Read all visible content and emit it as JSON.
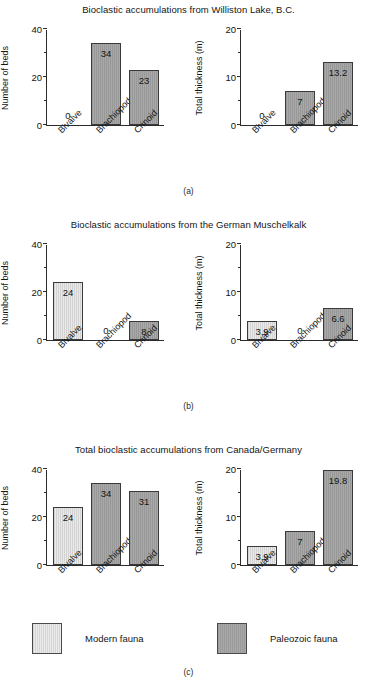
{
  "figure": {
    "panels": [
      {
        "caption": "(a)",
        "title": "Bioclastic accumulations from Williston Lake, B.C.",
        "charts": [
          {
            "ylabel": "Number of beds",
            "yticks": [
              "0",
              "20",
              "40"
            ],
            "ymax": 40,
            "categories": [
              "Bivalve",
              "Brachiopod",
              "Crinoid"
            ],
            "values": [
              0,
              34,
              23
            ],
            "labels": [
              "0",
              "34",
              "23"
            ],
            "fauna": [
              "modern",
              "paleo",
              "paleo"
            ]
          },
          {
            "ylabel": "Total thickness (m)",
            "yticks": [
              "0",
              "10",
              "20"
            ],
            "ymax": 20,
            "categories": [
              "Bivalve",
              "Brachiopod",
              "Crinoid"
            ],
            "values": [
              0,
              7,
              13.2
            ],
            "labels": [
              "0",
              "7",
              "13.2"
            ],
            "fauna": [
              "modern",
              "paleo",
              "paleo"
            ]
          }
        ]
      },
      {
        "caption": "(b)",
        "title": "Bioclastic accumulations from the German Muschelkalk",
        "charts": [
          {
            "ylabel": "Number of beds",
            "yticks": [
              "0",
              "20",
              "40"
            ],
            "ymax": 40,
            "categories": [
              "Bivalve",
              "Brachiopod",
              "Crinoid"
            ],
            "values": [
              24,
              0,
              8
            ],
            "labels": [
              "24",
              "0",
              "8"
            ],
            "fauna": [
              "modern",
              "paleo",
              "paleo"
            ]
          },
          {
            "ylabel": "Total thickness (m)",
            "yticks": [
              "0",
              "10",
              "20"
            ],
            "ymax": 20,
            "categories": [
              "Bivalve",
              "Brachiopod",
              "Crinoid"
            ],
            "values": [
              3.9,
              0,
              6.6
            ],
            "labels": [
              "3.9",
              "0",
              "6.6"
            ],
            "fauna": [
              "modern",
              "paleo",
              "paleo"
            ]
          }
        ]
      },
      {
        "caption": "(c)",
        "title": "Total bioclastic accumulations from Canada/Germany",
        "charts": [
          {
            "ylabel": "Number of beds",
            "yticks": [
              "0",
              "20",
              "40"
            ],
            "ymax": 40,
            "categories": [
              "Bivalve",
              "Brachiopod",
              "Crinoid"
            ],
            "values": [
              24,
              34,
              31
            ],
            "labels": [
              "24",
              "34",
              "31"
            ],
            "fauna": [
              "modern",
              "paleo",
              "paleo"
            ]
          },
          {
            "ylabel": "Total thickness (m)",
            "yticks": [
              "0",
              "10",
              "20"
            ],
            "ymax": 20,
            "categories": [
              "Bivalve",
              "Brachiopod",
              "Crinoid"
            ],
            "values": [
              3.9,
              7,
              19.8
            ],
            "labels": [
              "3.9",
              "7",
              "19.8"
            ],
            "fauna": [
              "modern",
              "paleo",
              "paleo"
            ]
          }
        ]
      }
    ],
    "legend": [
      {
        "label": "Modern fauna",
        "fauna": "modern",
        "color": "#e9e9e9"
      },
      {
        "label": "Paleozoic fauna",
        "fauna": "paleo",
        "color": "#a9a9a9"
      }
    ]
  },
  "chart_data": [
    {
      "type": "bar",
      "panel": "(a)",
      "subplot": "left",
      "title": "Bioclastic accumulations from Williston Lake, B.C.",
      "xlabel": "",
      "ylabel": "Number of beds",
      "categories": [
        "Bivalve",
        "Brachiopod",
        "Crinoid"
      ],
      "values": [
        0,
        34,
        23
      ],
      "ylim": [
        0,
        40
      ],
      "yticks": [
        0,
        20,
        40
      ],
      "grid": false,
      "legend_position": "bottom",
      "series_group": [
        "Modern fauna",
        "Paleozoic fauna",
        "Paleozoic fauna"
      ]
    },
    {
      "type": "bar",
      "panel": "(a)",
      "subplot": "right",
      "title": "Bioclastic accumulations from Williston Lake, B.C.",
      "xlabel": "",
      "ylabel": "Total thickness (m)",
      "categories": [
        "Bivalve",
        "Brachiopod",
        "Crinoid"
      ],
      "values": [
        0,
        7,
        13.2
      ],
      "ylim": [
        0,
        20
      ],
      "yticks": [
        0,
        10,
        20
      ],
      "grid": false,
      "legend_position": "bottom",
      "series_group": [
        "Modern fauna",
        "Paleozoic fauna",
        "Paleozoic fauna"
      ]
    },
    {
      "type": "bar",
      "panel": "(b)",
      "subplot": "left",
      "title": "Bioclastic accumulations from the German Muschelkalk",
      "xlabel": "",
      "ylabel": "Number of beds",
      "categories": [
        "Bivalve",
        "Brachiopod",
        "Crinoid"
      ],
      "values": [
        24,
        0,
        8
      ],
      "ylim": [
        0,
        40
      ],
      "yticks": [
        0,
        20,
        40
      ],
      "grid": false,
      "legend_position": "bottom",
      "series_group": [
        "Modern fauna",
        "Paleozoic fauna",
        "Paleozoic fauna"
      ]
    },
    {
      "type": "bar",
      "panel": "(b)",
      "subplot": "right",
      "title": "Bioclastic accumulations from the German Muschelkalk",
      "xlabel": "",
      "ylabel": "Total thickness (m)",
      "categories": [
        "Bivalve",
        "Brachiopod",
        "Crinoid"
      ],
      "values": [
        3.9,
        0,
        6.6
      ],
      "ylim": [
        0,
        20
      ],
      "yticks": [
        0,
        10,
        20
      ],
      "grid": false,
      "legend_position": "bottom",
      "series_group": [
        "Modern fauna",
        "Paleozoic fauna",
        "Paleozoic fauna"
      ]
    },
    {
      "type": "bar",
      "panel": "(c)",
      "subplot": "left",
      "title": "Total bioclastic accumulations from Canada/Germany",
      "xlabel": "",
      "ylabel": "Number of beds",
      "categories": [
        "Bivalve",
        "Brachiopod",
        "Crinoid"
      ],
      "values": [
        24,
        34,
        31
      ],
      "ylim": [
        0,
        40
      ],
      "yticks": [
        0,
        20,
        40
      ],
      "grid": false,
      "legend_position": "bottom",
      "series_group": [
        "Modern fauna",
        "Paleozoic fauna",
        "Paleozoic fauna"
      ]
    },
    {
      "type": "bar",
      "panel": "(c)",
      "subplot": "right",
      "title": "Total bioclastic accumulations from Canada/Germany",
      "xlabel": "",
      "ylabel": "Total thickness (m)",
      "categories": [
        "Bivalve",
        "Brachiopod",
        "Crinoid"
      ],
      "values": [
        3.9,
        7,
        19.8
      ],
      "ylim": [
        0,
        20
      ],
      "yticks": [
        0,
        10,
        20
      ],
      "grid": false,
      "legend_position": "bottom",
      "series_group": [
        "Modern fauna",
        "Paleozoic fauna",
        "Paleozoic fauna"
      ]
    }
  ]
}
